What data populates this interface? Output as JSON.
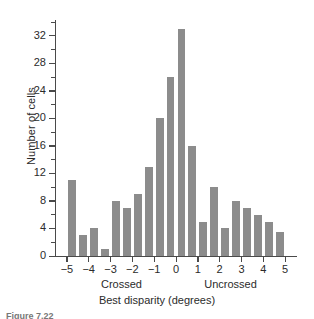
{
  "figure": {
    "caption": "Figure 7.22"
  },
  "chart_data": {
    "type": "bar",
    "title": "",
    "xlabel": "Best disparity (degrees)",
    "ylabel": "Number of cells",
    "xlim": [
      -5.5,
      5.5
    ],
    "ylim": [
      0,
      34
    ],
    "grid": false,
    "legend": null,
    "bin_width": 0.5,
    "x_tick_labels": [
      "−5",
      "−4",
      "−3",
      "−2",
      "−1",
      "0",
      "1",
      "2",
      "3",
      "4",
      "5"
    ],
    "x_tick_values": [
      -5,
      -4,
      -3,
      -2,
      -1,
      0,
      1,
      2,
      3,
      4,
      5
    ],
    "y_tick_labels": [
      "0",
      "4",
      "8",
      "12",
      "16",
      "20",
      "24",
      "28",
      "32"
    ],
    "y_tick_values": [
      0,
      4,
      8,
      12,
      16,
      20,
      24,
      28,
      32
    ],
    "y_minor_ticks": [
      2,
      6,
      10,
      14,
      18,
      22,
      26,
      30,
      34
    ],
    "region_labels": [
      {
        "text": "Crossed",
        "center_x": -2.5
      },
      {
        "text": "Uncrossed",
        "center_x": 2.5
      }
    ],
    "bar_color": "#8c8c8c",
    "axis_color": "#4a4a4a",
    "categories": [
      -5.0,
      -4.5,
      -4.0,
      -3.5,
      -3.0,
      -2.5,
      -2.0,
      -1.5,
      -1.0,
      -0.5,
      0.0,
      0.5,
      1.0,
      1.5,
      2.0,
      2.5,
      3.0,
      3.5,
      4.0,
      4.5
    ],
    "values": [
      11,
      3,
      4,
      1,
      8,
      7,
      9,
      13,
      20,
      26,
      33,
      16,
      5,
      10,
      4,
      8,
      7,
      6,
      5,
      3.5
    ]
  }
}
